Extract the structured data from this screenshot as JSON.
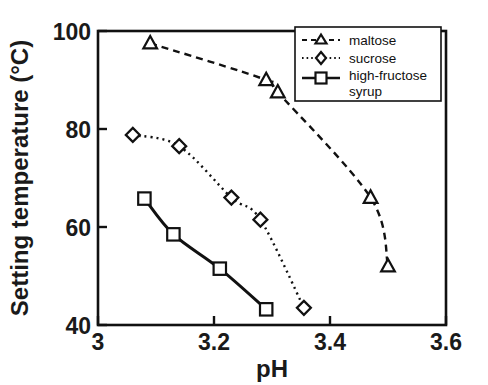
{
  "chart_data": {
    "type": "scatter",
    "title": "",
    "xlabel": "pH",
    "ylabel": "Setting temperature (°C)",
    "xlim": [
      3,
      3.6
    ],
    "ylim": [
      40,
      100
    ],
    "xticks": [
      "3",
      "3.2",
      "3.4",
      "3.6"
    ],
    "xtick_values": [
      3,
      3.2,
      3.4,
      3.6
    ],
    "yticks": [
      "40",
      "60",
      "80",
      "100"
    ],
    "ytick_values": [
      40,
      60,
      80,
      100
    ],
    "grid": false,
    "legend_position": "top-right",
    "series": [
      {
        "name": "maltose",
        "marker": "triangle",
        "linestyle": "dashed",
        "x": [
          3.09,
          3.29,
          3.31,
          3.47,
          3.5
        ],
        "y": [
          97.5,
          90.0,
          87.5,
          66.0,
          52.0
        ]
      },
      {
        "name": "sucrose",
        "marker": "diamond",
        "linestyle": "dotted",
        "x": [
          3.06,
          3.14,
          3.23,
          3.28,
          3.355
        ],
        "y": [
          78.8,
          76.5,
          66.0,
          61.5,
          43.5
        ]
      },
      {
        "name": "high-fructose syrup",
        "marker": "square",
        "linestyle": "solid",
        "x": [
          3.08,
          3.13,
          3.21,
          3.29
        ],
        "y": [
          65.8,
          58.5,
          51.5,
          43.2
        ]
      }
    ]
  },
  "axes": {
    "x_title": "pH",
    "y_title": "Setting temperature (°C)",
    "x_tick_labels": [
      "3",
      "3.2",
      "3.4",
      "3.6"
    ],
    "y_tick_labels": [
      "100",
      "80",
      "60",
      "40"
    ]
  },
  "legend": {
    "entries": [
      {
        "label": "maltose",
        "marker": "triangle-up",
        "linestyle": "dashed"
      },
      {
        "label": "sucrose",
        "marker": "diamond",
        "linestyle": "dotted"
      },
      {
        "label": "high-fructose",
        "label2": "syrup",
        "marker": "square",
        "linestyle": "solid"
      }
    ]
  },
  "colors": {
    "ink": "#111111",
    "background": "#ffffff"
  }
}
